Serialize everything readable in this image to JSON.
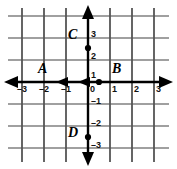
{
  "figure": {
    "kind": "coordinate-plane-diagram",
    "width": 177,
    "height": 169,
    "background_color": "#ffffff",
    "grid": {
      "visible": true,
      "spacing_px": 22,
      "vertical_line_color": "#555555",
      "horizontal_line_color": "#808080",
      "vertical_line_count": 7,
      "horizontal_line_count": 7
    },
    "axes": {
      "color": "#000000",
      "origin_px": {
        "x": 88,
        "y": 82
      },
      "x_axis": {
        "arrow_left": true,
        "arrow_right": true,
        "range": [
          -3.6,
          3.6
        ]
      },
      "y_axis": {
        "arrow_up": true,
        "arrow_down": true,
        "range": [
          -3.6,
          3.6
        ]
      },
      "extra_x_arrowheads": [
        -2,
        -1
      ]
    },
    "x_tick_labels": [
      {
        "text": "–3",
        "value": -3
      },
      {
        "text": "–2",
        "value": -2
      },
      {
        "text": "–1",
        "value": -1
      },
      {
        "text": "0",
        "value": 0
      },
      {
        "text": "1",
        "value": 1
      },
      {
        "text": "2",
        "value": 2
      },
      {
        "text": "3",
        "value": 3
      }
    ],
    "y_tick_labels": [
      {
        "text": "3",
        "value": 3
      },
      {
        "text": "2",
        "value": 2
      },
      {
        "text": "1",
        "value": 1
      },
      {
        "text": "0",
        "value": 0
      },
      {
        "text": "–1",
        "value": -1
      },
      {
        "text": "–2",
        "value": -2
      },
      {
        "text": "–3",
        "value": -3
      }
    ],
    "point_labels": [
      {
        "id": "A",
        "text": "A",
        "x_px": 38,
        "y_px": 62,
        "has_dot": false
      },
      {
        "id": "B",
        "text": "B",
        "x_px": 112,
        "y_px": 62,
        "has_dot": true,
        "dot_x_px": 99,
        "dot_y_px": 82
      },
      {
        "id": "C",
        "text": "C",
        "x_px": 68,
        "y_px": 28,
        "has_dot": true,
        "dot_x_px": 88,
        "dot_y_px": 48
      },
      {
        "id": "D",
        "text": "D",
        "x_px": 68,
        "y_px": 126,
        "has_dot": true,
        "dot_x_px": 88,
        "dot_y_px": 137
      }
    ]
  }
}
